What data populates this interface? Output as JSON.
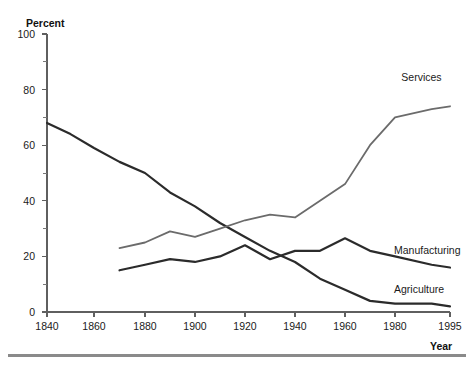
{
  "chart_data": {
    "type": "line",
    "title": "",
    "xlabel": "Year",
    "ylabel": "Percent",
    "xlim": [
      1840,
      1995
    ],
    "ylim": [
      0,
      100
    ],
    "grid": false,
    "legend_position": "inline-right-of-line-ends",
    "x_ticks_major": [
      1840,
      1860,
      1880,
      1900,
      1920,
      1940,
      1960,
      1980,
      1995
    ],
    "x_tick_labels": [
      "1840",
      "1860",
      "1880",
      "1900",
      "1920",
      "1940",
      "1960",
      "1980",
      "1995"
    ],
    "y_ticks_major": [
      0,
      20,
      40,
      60,
      80,
      100
    ],
    "y_tick_labels": [
      "0",
      "20",
      "40",
      "60",
      "80",
      "100"
    ],
    "y_ticks_minor": [
      10,
      30,
      50,
      70,
      90
    ],
    "series": [
      {
        "name": "Agriculture",
        "color": "#2b2b2b",
        "width": 2.2,
        "x": [
          1840,
          1850,
          1860,
          1870,
          1880,
          1890,
          1900,
          1910,
          1920,
          1930,
          1940,
          1950,
          1960,
          1970,
          1980,
          1990,
          1995
        ],
        "values": [
          68,
          64,
          59,
          54,
          50,
          43,
          38,
          32,
          27,
          22,
          18,
          12,
          8,
          4,
          3,
          3,
          2
        ]
      },
      {
        "name": "Manufacturing",
        "color": "#2b2b2b",
        "width": 2.2,
        "x": [
          1870,
          1880,
          1890,
          1900,
          1910,
          1920,
          1930,
          1940,
          1950,
          1960,
          1970,
          1980,
          1990,
          1995
        ],
        "values": [
          15,
          17,
          19,
          18,
          20,
          24,
          19,
          22,
          22,
          26.5,
          22,
          20,
          17,
          16
        ]
      },
      {
        "name": "Services",
        "color": "#6b6b6b",
        "width": 1.8,
        "x": [
          1870,
          1880,
          1890,
          1900,
          1910,
          1920,
          1930,
          1940,
          1950,
          1960,
          1970,
          1980,
          1990,
          1995
        ],
        "values": [
          23,
          25,
          29,
          27,
          30,
          33,
          35,
          34,
          40,
          46,
          60,
          70,
          73,
          74
        ]
      }
    ],
    "annotations": [
      {
        "name": "Services",
        "x": 1985,
        "y": 84
      },
      {
        "name": "Manufacturing",
        "x": 1983,
        "y": 22
      },
      {
        "name": "Agriculture",
        "x": 1983,
        "y": 8
      }
    ]
  },
  "axis": {
    "y_title": "Percent",
    "x_title": "Year"
  }
}
